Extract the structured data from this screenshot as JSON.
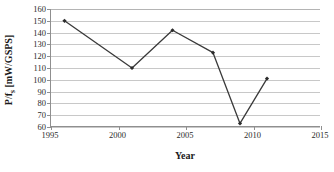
{
  "chart_data": {
    "type": "line",
    "title": "",
    "xlabel": "Year",
    "ylabel": "P/f_s [mW/GSPS]",
    "ylabel_parts": {
      "prefix": "P/f",
      "subscript": "s",
      "suffix": " [mW/GSPS]"
    },
    "x": [
      1996,
      2001,
      2004,
      2007,
      2009,
      2011
    ],
    "values": [
      150,
      110,
      142,
      123,
      63,
      101
    ],
    "points": [
      {
        "x": 1996,
        "y": 150
      },
      {
        "x": 2001,
        "y": 110
      },
      {
        "x": 2004,
        "y": 142
      },
      {
        "x": 2007,
        "y": 123
      },
      {
        "x": 2009,
        "y": 63
      },
      {
        "x": 2011,
        "y": 101
      }
    ],
    "xlim": [
      1995,
      2015
    ],
    "ylim": [
      60,
      160
    ],
    "xticks": [
      1995,
      2000,
      2005,
      2010,
      2015
    ],
    "xtick_labels": [
      "1995",
      "2000",
      "2005",
      "2010",
      "2015"
    ],
    "yticks": [
      60,
      70,
      80,
      90,
      100,
      110,
      120,
      130,
      140,
      150,
      160
    ],
    "ytick_labels": [
      "60",
      "70",
      "80",
      "90",
      "100",
      "110",
      "120",
      "130",
      "140",
      "150",
      "160"
    ],
    "grid": {
      "horizontal": true,
      "vertical": false
    },
    "legend": {
      "visible": false,
      "position": "none"
    },
    "series_color": "#3a3a3a",
    "marker": "diamond",
    "marker_color": "#2b2b2b",
    "grid_color": "#c8c8c8",
    "axis_color": "#8f8f8f",
    "background": "#ffffff"
  }
}
